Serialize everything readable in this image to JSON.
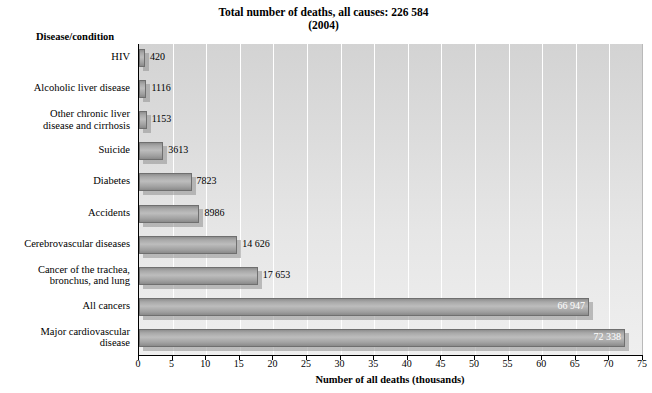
{
  "title": {
    "line1": "Total number of deaths, all causes: 226 584",
    "line2": "(2004)"
  },
  "category_axis_label": "Disease/condition",
  "chart_data": {
    "type": "bar",
    "orientation": "horizontal",
    "title": "Total number of deaths, all causes: 226 584 (2004)",
    "xlabel": "Number of all deaths (thousands)",
    "ylabel": "Disease/condition",
    "xlim": [
      0,
      75
    ],
    "xticks": [
      "0",
      "5",
      "10",
      "15",
      "20",
      "25",
      "30",
      "35",
      "40",
      "45",
      "50",
      "55",
      "60",
      "65",
      "70",
      "75"
    ],
    "grid": true,
    "legend": "none",
    "units": "deaths (bar labels in persons; axis in thousands)",
    "categories": [
      "HIV",
      "Alcoholic liver disease",
      "Other chronic liver disease and cirrhosis",
      "Suicide",
      "Diabetes",
      "Accidents",
      "Cerebrovascular diseases",
      "Cancer of the trachea, bronchus, and lung",
      "All cancers",
      "Major cardiovascular disease"
    ],
    "category_labels": [
      [
        "HIV"
      ],
      [
        "Alcoholic liver disease"
      ],
      [
        "Other chronic liver",
        "disease and cirrhosis"
      ],
      [
        "Suicide"
      ],
      [
        "Diabetes"
      ],
      [
        "Accidents"
      ],
      [
        "Cerebrovascular diseases"
      ],
      [
        "Cancer of the trachea,",
        "bronchus, and lung"
      ],
      [
        "All cancers"
      ],
      [
        "Major cardiovascular",
        "disease"
      ]
    ],
    "values": [
      420,
      1116,
      1153,
      3613,
      7823,
      8986,
      14626,
      17653,
      66947,
      72338
    ],
    "value_labels": [
      "420",
      "1116",
      "1153",
      "3613",
      "7823",
      "8986",
      "14 626",
      "17 653",
      "66 947",
      "72 338"
    ],
    "label_position": [
      "outside",
      "outside",
      "outside",
      "outside",
      "outside",
      "outside",
      "outside",
      "outside",
      "inside",
      "inside"
    ]
  },
  "colors": {
    "plot_background": "#dcdcdc",
    "bar_fill": "#a8a8a8",
    "bar_edge": "#6f6f6f",
    "gridline": "#ffffff",
    "axis": "#000000",
    "label_inside": "#ffffff",
    "label_outside": "#000000"
  }
}
